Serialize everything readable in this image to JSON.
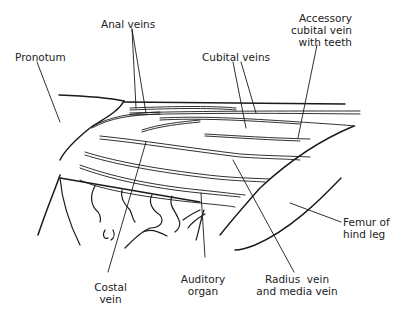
{
  "figure": {
    "line_color": "#1a1a1a",
    "background": "#ffffff"
  },
  "labels": {
    "anal_veins": "Anal veins",
    "pronotum": "Pronotum",
    "cubital_veins": "Cubital veins",
    "accessory_cubital": "Accessory\ncubital vein\nwith teeth",
    "costal_vein": "Costal\nvein",
    "auditory_organ": "Auditory\norgan",
    "radius_media": "Radius  vein\nand media vein",
    "femur": "Femur of\nhind leg"
  }
}
